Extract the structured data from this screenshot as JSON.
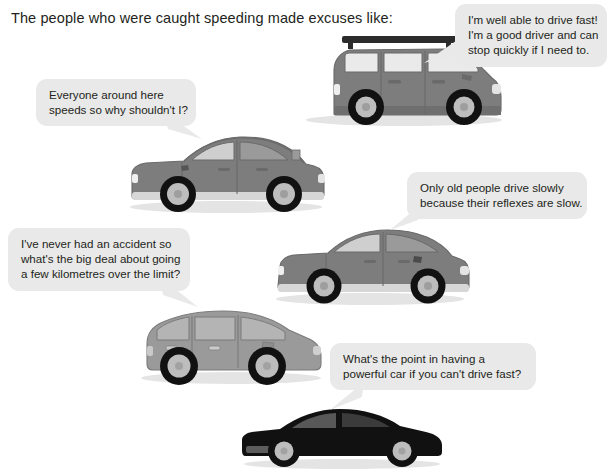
{
  "page": {
    "background_color": "#ffffff",
    "heading": "The people who were caught speeding made excuses like:"
  },
  "palette": {
    "bubble_fill": "#e9e9e9",
    "text_color": "#231f20",
    "car_body_grey": "#7d7d7d",
    "car_body_dark_grey": "#6f6f6f",
    "car_body_light_grey": "#9a9a9a",
    "car_window_light": "#e9e9e9",
    "car_window_tint": "#8d8d8d",
    "car_black": "#111111",
    "tyre_black": "#111111",
    "hub_grey": "#bdbdbd",
    "roof_rack": "#2b2b2b",
    "shadow": "#e4e4e4"
  },
  "bubbles": [
    {
      "id": "bubble-suv",
      "name": "speech-bubble-suv",
      "tail": "bottom-left",
      "lines": [
        "I'm well able to drive fast!",
        "I'm a good driver and can",
        "stop quickly if I need to."
      ]
    },
    {
      "id": "bubble-sedan",
      "name": "speech-bubble-sedan",
      "tail": "bottom-right",
      "lines": [
        "Everyone around here",
        "speeds so why shouldn't I?"
      ]
    },
    {
      "id": "bubble-coupe",
      "name": "speech-bubble-coupe",
      "tail": "bottom-left",
      "lines": [
        "Only old people drive slowly",
        "because their reflexes are slow."
      ]
    },
    {
      "id": "bubble-hatchback",
      "name": "speech-bubble-hatchback",
      "tail": "bottom-right",
      "lines": [
        "I've never had an accident so",
        "what's the big deal about going",
        "a few kilometres over the limit?"
      ]
    },
    {
      "id": "bubble-sportscar",
      "name": "speech-bubble-sportscar",
      "tail": "bottom-left",
      "lines": [
        "What's the point in having a",
        "powerful car if you can't drive fast?"
      ]
    }
  ],
  "cars": [
    {
      "id": "car-suv",
      "name": "car-illustration-suv",
      "type": "suv-with-roof-rack",
      "color": "grey",
      "facing": "right"
    },
    {
      "id": "car-sedan",
      "name": "car-illustration-sedan",
      "type": "sedan",
      "color": "grey",
      "facing": "right"
    },
    {
      "id": "car-coupe",
      "name": "car-illustration-coupe",
      "type": "coupe",
      "color": "grey",
      "facing": "right"
    },
    {
      "id": "car-hatchback",
      "name": "car-illustration-hatchback",
      "type": "hatchback-mpv",
      "color": "light-grey",
      "facing": "right"
    },
    {
      "id": "car-sportscar",
      "name": "car-illustration-sportscar",
      "type": "sports-car",
      "color": "black",
      "facing": "right"
    }
  ]
}
